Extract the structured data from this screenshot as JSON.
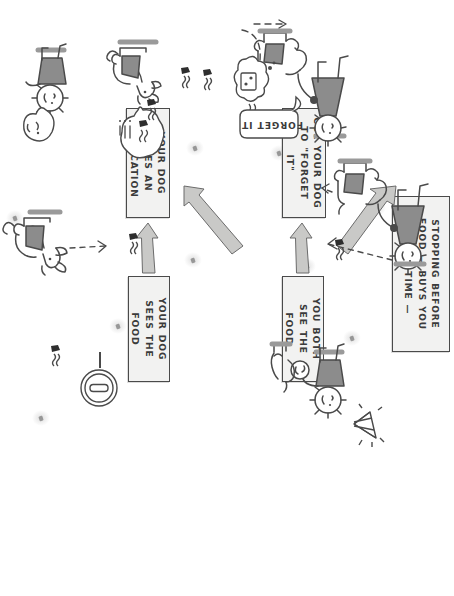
{
  "page": {
    "kind": "hand-drawn-flowchart",
    "orientation_note": "rotated-90-clockwise",
    "background_color": "#ffffff",
    "ink_color": "#3b3b3b",
    "box_fill_color": "#f2f2f1",
    "arrow_fill_color": "#c9c9c7",
    "shirt_fill_color": "#8c8c8c"
  },
  "nodes": [
    {
      "id": "stopping-before-food",
      "text": "Stopping before food — buys you some time —",
      "lines": [
        "STOPPING BEFORE FOOD",
        "— BUYS YOU SOME TIME —"
      ]
    },
    {
      "id": "you-both-see-the-food",
      "text": "You both see the food",
      "lines": [
        "YOU BOTH SEE",
        "THE FOOD"
      ]
    },
    {
      "id": "cue-your-dog-to-forget-it",
      "text": "Cue your dog to \"forget it\"",
      "lines": [
        "CUE YOUR DOG TO",
        "\"FORGET IT\""
      ]
    },
    {
      "id": "your-dog-sees-the-food",
      "text": "Your dog sees the food",
      "lines": [
        "YOUR DOG SEES",
        "THE FOOD"
      ]
    },
    {
      "id": "your-dog-gives-an-indication",
      "text": "Your dog gives an indication",
      "lines": [
        "YOUR DOG GIVES AN",
        "INDICATION"
      ]
    }
  ],
  "arrows": [
    {
      "id": "arrow-both-see-to-cue",
      "from": "you-both-see-the-food",
      "to": "cue-your-dog-to-forget-it",
      "style": "solid-block"
    },
    {
      "id": "arrow-stopping-to-both-see",
      "from": "stopping-before-food",
      "to": "you-both-see-the-food",
      "style": "solid-block-diagonal"
    },
    {
      "id": "arrow-stopping-to-dog-sees",
      "from": "stopping-before-food",
      "to": "your-dog-sees-the-food",
      "style": "solid-block-diagonal"
    },
    {
      "id": "arrow-dog-sees-to-indication",
      "from": "your-dog-sees-the-food",
      "to": "your-dog-gives-an-indication",
      "style": "solid-block"
    }
  ],
  "speech_bubbles": [
    {
      "id": "forget-it-bubble",
      "text": "FORGET IT",
      "speaker": "handler-top-left"
    },
    {
      "id": "dog-indication-bubble",
      "text": "",
      "contents": "food-and-scent-symbol-with-lines",
      "speaker": "dog-indicating"
    },
    {
      "id": "handler-happy-bubble",
      "text": "",
      "contents": "smiley-face",
      "speaker": "handler-bottom-left"
    }
  ],
  "illustrations": [
    {
      "id": "handler-walking-dog-top",
      "description": "Stick-figure handler on leash with dog, both looking toward food"
    },
    {
      "id": "handler-dog-forget-it",
      "description": "Handler cueing dog while dog thinks of food in a thought cloud"
    },
    {
      "id": "handler-dog-sparkle",
      "description": "Handler with dog and a sparkling gem reward"
    },
    {
      "id": "dog-indicating",
      "description": "Dog sitting and indicating the food scent"
    },
    {
      "id": "dog-sitting-bottom",
      "description": "Dog sitting alert"
    },
    {
      "id": "handler-happy-bottom",
      "description": "Handler smiling with speech bubble"
    },
    {
      "id": "stop-sign-icon",
      "description": "Circular stop/hand icon on a stick"
    },
    {
      "id": "food-thought-cloud",
      "description": "Cloud with a piece of food and scent waves"
    }
  ],
  "scent_marks": [
    {
      "id": "scent-mark-1"
    },
    {
      "id": "scent-mark-2"
    },
    {
      "id": "scent-mark-3"
    },
    {
      "id": "scent-mark-4"
    },
    {
      "id": "scent-mark-5"
    },
    {
      "id": "scent-mark-6"
    }
  ]
}
